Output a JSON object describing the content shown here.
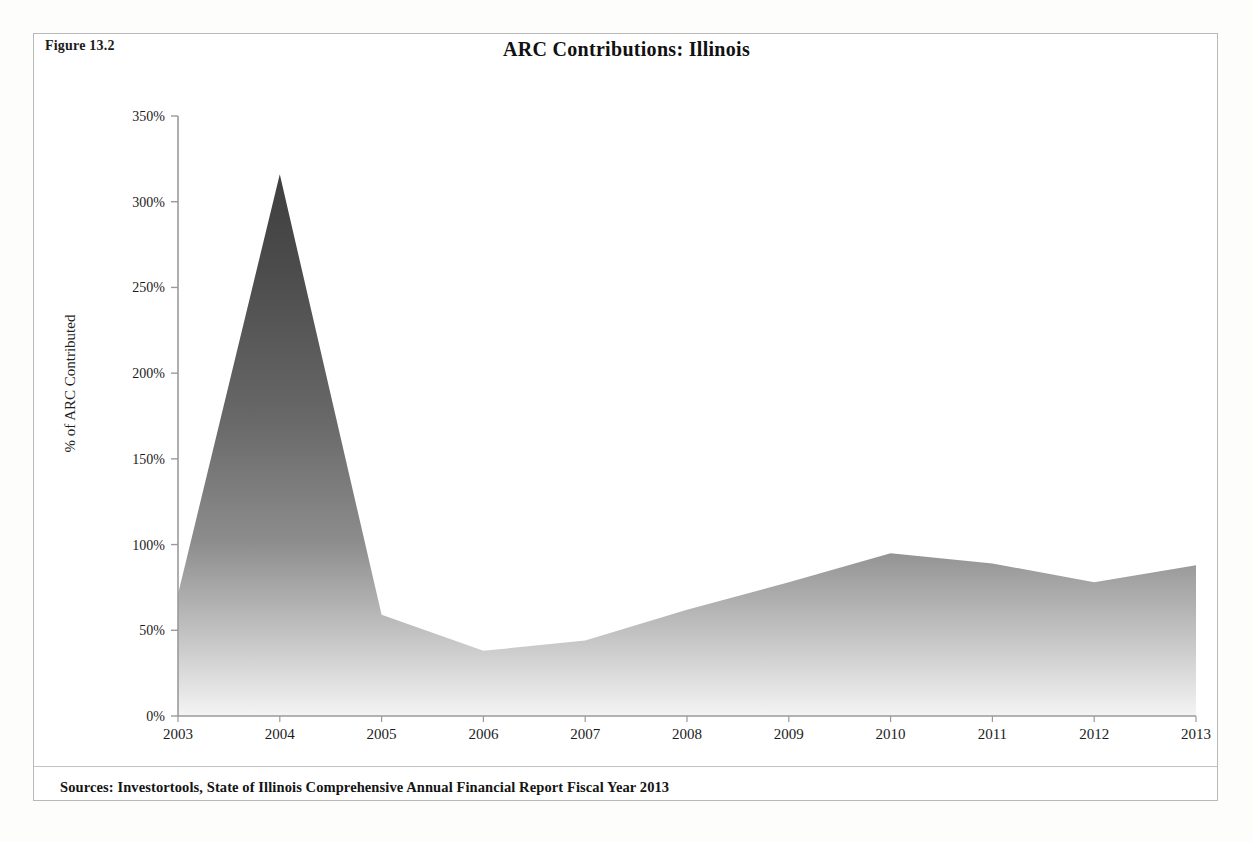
{
  "figure": {
    "label": "Figure 13.2",
    "source_note": "Sources: Investortools, State of Illinois Comprehensive Annual Financial Report Fiscal Year 2013"
  },
  "colors": {
    "area_top": "#4a4a4a",
    "area_bottom": "#f2f2f2",
    "axis": "#8a8a8a",
    "frame": "#b9b9b9",
    "text": "#1c1c1c"
  },
  "chart_data": {
    "type": "area",
    "title": "ARC Contributions: Illinois",
    "xlabel": "",
    "ylabel": "% of ARC Contributed",
    "categories": [
      "2003",
      "2004",
      "2005",
      "2006",
      "2007",
      "2008",
      "2009",
      "2010",
      "2011",
      "2012",
      "2013"
    ],
    "values": [
      71,
      316,
      59,
      38,
      44,
      62,
      78,
      95,
      89,
      78,
      88
    ],
    "value_labels": [
      "71%",
      "316%",
      "59%",
      "38%",
      "44%",
      "62%",
      "78%",
      "95%",
      "89%",
      "78%",
      "88%"
    ],
    "series": [
      {
        "name": "% of ARC Contributed",
        "values": [
          71,
          316,
          59,
          38,
          44,
          62,
          78,
          95,
          89,
          78,
          88
        ]
      }
    ],
    "ylim": [
      0,
      350
    ],
    "ytick_labels": [
      "0%",
      "50%",
      "100%",
      "150%",
      "200%",
      "250%",
      "300%",
      "350%"
    ],
    "ytick_values": [
      0,
      50,
      100,
      150,
      200,
      250,
      300,
      350
    ],
    "xtick_labels": [
      "2003",
      "2004",
      "2005",
      "2006",
      "2007",
      "2008",
      "2009",
      "2010",
      "2011",
      "2012",
      "2013"
    ],
    "grid": false,
    "legend": "none",
    "fill": "vertical-gradient-dark-to-light"
  }
}
